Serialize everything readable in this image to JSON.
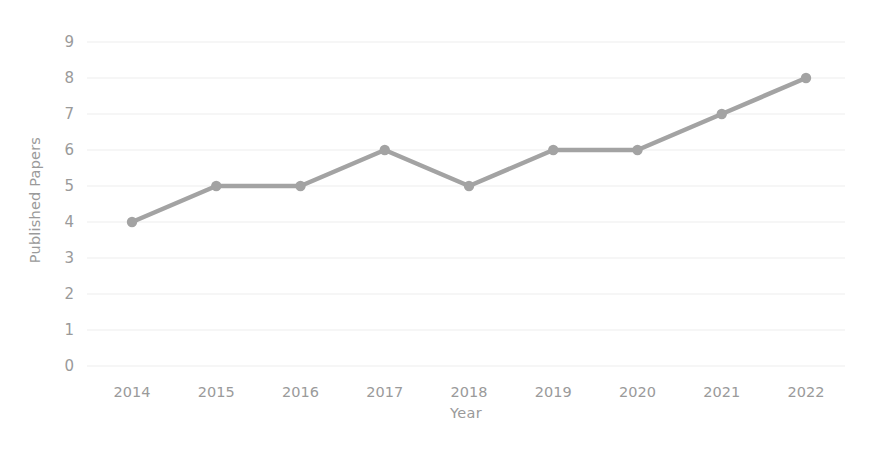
{
  "chart_data": {
    "type": "line",
    "title": "",
    "xlabel": "Year",
    "ylabel": "Published Papers",
    "categories": [
      "2014",
      "2015",
      "2016",
      "2017",
      "2018",
      "2019",
      "2020",
      "2021",
      "2022"
    ],
    "x": [
      2014,
      2015,
      2016,
      2017,
      2018,
      2019,
      2020,
      2021,
      2022
    ],
    "values": [
      4,
      5,
      5,
      6,
      5,
      6,
      6,
      7,
      8
    ],
    "series": [
      {
        "name": "Published Papers",
        "values": [
          4,
          5,
          5,
          6,
          5,
          6,
          6,
          7,
          8
        ]
      }
    ],
    "ylim": [
      0,
      9
    ],
    "yticks": [
      0,
      1,
      2,
      3,
      4,
      5,
      6,
      7,
      8,
      9
    ],
    "ytick_labels": [
      "0",
      "1",
      "2",
      "3",
      "4",
      "5",
      "6",
      "7",
      "8",
      "9"
    ],
    "xlim": [
      2014,
      2022
    ],
    "grid": "horizontal",
    "legend": "none",
    "marker": "circle",
    "line_color": "#a3a3a3",
    "marker_color": "#a3a3a3",
    "grid_color": "#ededed",
    "text_color": "#9a9a9a",
    "background_color": "#ffffff",
    "annotations": []
  },
  "axis": {
    "y_title": "Published Papers",
    "x_title": "Year"
  }
}
